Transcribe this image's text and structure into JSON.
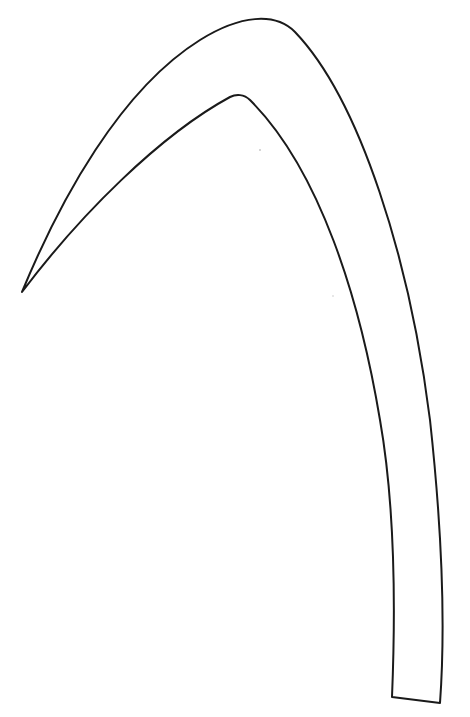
{
  "canvas": {
    "width": 470,
    "height": 717,
    "background": "#ffffff"
  },
  "shape": {
    "description": "curved horn / sickle outline",
    "stroke_color": "#1a1a1a",
    "fill_color": "#ffffff",
    "path": "M 22 292 C 60 200, 120 90, 200 40 C 240 15, 275 12, 295 32 C 360 100, 410 260, 430 420 C 442 530, 446 620, 440 703 L 392 697 C 396 600, 394 500, 380 420 C 360 300, 320 170, 250 100 C 244 94, 236 94, 230 97 C 160 135, 80 215, 22 292 Z"
  },
  "specks": [
    {
      "cx": 260,
      "cy": 150,
      "r": 1
    },
    {
      "cx": 333,
      "cy": 296,
      "r": 0.8
    }
  ]
}
